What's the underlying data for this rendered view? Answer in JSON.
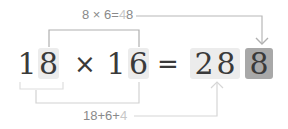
{
  "top_annotation": {
    "prefix": "8 × 6=",
    "dim": "4",
    "suffix": "8"
  },
  "bottom_annotation": {
    "prefix": "18+6+",
    "dim": "4"
  },
  "equation": {
    "a_tens": "1",
    "a_units": "8",
    "op": "×",
    "b_tens": "1",
    "b_units": "6",
    "eq": "=",
    "r_hundreds": "2",
    "r_tens": "8",
    "r_units": "8"
  },
  "colors": {
    "digit": "#3a3a3a",
    "box_light": "#ececec",
    "box_dark": "#a8a8a8",
    "line": "#b5b5b5",
    "label": "#8a8a8a"
  }
}
